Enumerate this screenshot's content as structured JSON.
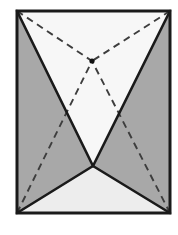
{
  "figure": {
    "type": "line-drawing",
    "canvas": {
      "width": 178,
      "height": 235,
      "background": "#ffffff"
    },
    "colors": {
      "stroke": "#1a1a1a",
      "dashed_stroke": "#3d3d3d",
      "fill_shaded": "#a8a8a8",
      "fill_light_top": "#f7f7f7",
      "fill_light_bottom": "#ededed",
      "frame_interior": "#f2f2f2",
      "vertex_dot": "#111111",
      "background": "#ffffff"
    },
    "stroke_widths": {
      "frame": 3.0,
      "solid_edge": 2.6,
      "dashed_edge": 1.9
    },
    "dash_pattern": "7,5",
    "points": {
      "top_left": {
        "name": "top-left-corner",
        "x": 17,
        "y": 11
      },
      "top_right": {
        "name": "top-right-corner",
        "x": 170,
        "y": 11
      },
      "bottom_right": {
        "name": "bottom-right-corner",
        "x": 170,
        "y": 213
      },
      "bottom_left": {
        "name": "bottom-left-corner",
        "x": 17,
        "y": 213
      },
      "lower_apex": {
        "name": "lower-apex-vertex",
        "x": 93,
        "y": 166
      },
      "hidden_apex": {
        "name": "hidden-apex-vertex",
        "x": 92,
        "y": 61
      }
    },
    "regions": [
      {
        "id": "left-shaded-region",
        "label": "Left shaded face",
        "fill": "#a8a8a8",
        "polygon": "17,11 93,166 17,213"
      },
      {
        "id": "right-shaded-region",
        "label": "Right shaded face",
        "fill": "#a8a8a8",
        "polygon": "170,11 170,213 93,166"
      },
      {
        "id": "top-light-region",
        "label": "Top light face",
        "fill": "#f7f7f7",
        "polygon": "17,11 170,11 93,166"
      },
      {
        "id": "bottom-light-region",
        "label": "Bottom light face",
        "fill": "#ededed",
        "polygon": "17,213 93,166 170,213"
      }
    ],
    "solid_edges": [
      {
        "id": "edge-top-left-to-apex",
        "label": "Top-left to lower apex",
        "from": "top_left",
        "to": "lower_apex"
      },
      {
        "id": "edge-top-right-to-apex",
        "label": "Top-right to lower apex",
        "from": "top_right",
        "to": "lower_apex"
      },
      {
        "id": "edge-apex-to-bottom-left",
        "label": "Lower apex to bottom-left",
        "from": "lower_apex",
        "to": "bottom_left"
      },
      {
        "id": "edge-apex-to-bottom-right",
        "label": "Lower apex to bottom-right",
        "from": "lower_apex",
        "to": "bottom_right"
      }
    ],
    "dashed_edges": [
      {
        "id": "hidden-edge-top-left",
        "label": "Hidden edge to top-left",
        "from": "top_left",
        "to": "hidden_apex"
      },
      {
        "id": "hidden-edge-top-right",
        "label": "Hidden edge to top-right",
        "from": "top_right",
        "to": "hidden_apex"
      },
      {
        "id": "hidden-edge-bottom-left",
        "label": "Hidden edge to bottom-left",
        "from": "bottom_left",
        "to": "hidden_apex"
      },
      {
        "id": "hidden-edge-bottom-right",
        "label": "Hidden edge to bottom-right",
        "from": "bottom_right",
        "to": "hidden_apex"
      }
    ],
    "frame": {
      "id": "outer-rectangle-frame",
      "label": "Outer rectangle frame",
      "x": 17,
      "y": 11,
      "width": 153,
      "height": 202
    },
    "vertex_marker": {
      "id": "hidden-apex-dot",
      "label": "Hidden apex marker dot",
      "x": 92,
      "y": 61,
      "r": 2.6
    }
  }
}
